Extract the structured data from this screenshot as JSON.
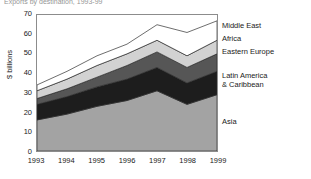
{
  "title": "Exports by destination, 1993-99",
  "axis": {
    "ylabel": "$ billions",
    "yticks": [
      "70",
      "60",
      "50",
      "40",
      "30",
      "20",
      "10",
      "0"
    ],
    "xticks": [
      "1993",
      "1994",
      "1995",
      "1996",
      "1997",
      "1998",
      "1999"
    ]
  },
  "legend": [
    {
      "label": "Middle East",
      "color": "#ffffff"
    },
    {
      "label": "Africa",
      "color": "#d2d2d2"
    },
    {
      "label": "Eastern Europe",
      "color": "#565656"
    },
    {
      "label": "Latin America\n& Caribbean",
      "color": "#1d1d1d"
    },
    {
      "label": "Asia",
      "color": "#a3a3a3"
    }
  ],
  "chart_data": {
    "type": "area",
    "stacked": true,
    "title": "Exports by destination, 1993-99",
    "xlabel": "",
    "ylabel": "$ billions",
    "ylim": [
      0,
      70
    ],
    "xticklabels": [
      "1993",
      "1994",
      "1995",
      "1996",
      "1997",
      "1998",
      "1999"
    ],
    "categories": [
      "1993",
      "1994",
      "1995",
      "1996",
      "1997",
      "1998",
      "1999"
    ],
    "grid": false,
    "legend_position": "right",
    "series": [
      {
        "name": "Asia",
        "color": "#a3a3a3",
        "values": [
          16,
          19,
          23,
          26,
          31,
          24,
          29
        ]
      },
      {
        "name": "Latin America & Caribbean",
        "color": "#1d1d1d",
        "values": [
          8,
          9,
          10,
          11,
          12,
          11,
          12
        ]
      },
      {
        "name": "Eastern Europe",
        "color": "#565656",
        "values": [
          3,
          4,
          5,
          7,
          8,
          8,
          9
        ]
      },
      {
        "name": "Africa",
        "color": "#d2d2d2",
        "values": [
          4,
          5,
          6,
          6,
          6,
          6,
          7
        ]
      },
      {
        "name": "Middle East",
        "color": "#ffffff",
        "values": [
          3,
          4,
          5,
          5,
          8,
          12,
          10
        ]
      }
    ],
    "cumulative_tops": {
      "Asia": [
        16,
        19,
        23,
        26,
        31,
        24,
        29
      ],
      "Latin America & Caribbean": [
        24,
        28,
        33,
        37,
        43,
        35,
        41
      ],
      "Eastern Europe": [
        27,
        32,
        38,
        44,
        51,
        43,
        50
      ],
      "Africa": [
        31,
        37,
        44,
        50,
        57,
        49,
        57
      ],
      "Middle East": [
        34,
        41,
        49,
        55,
        65,
        61,
        67
      ]
    }
  }
}
